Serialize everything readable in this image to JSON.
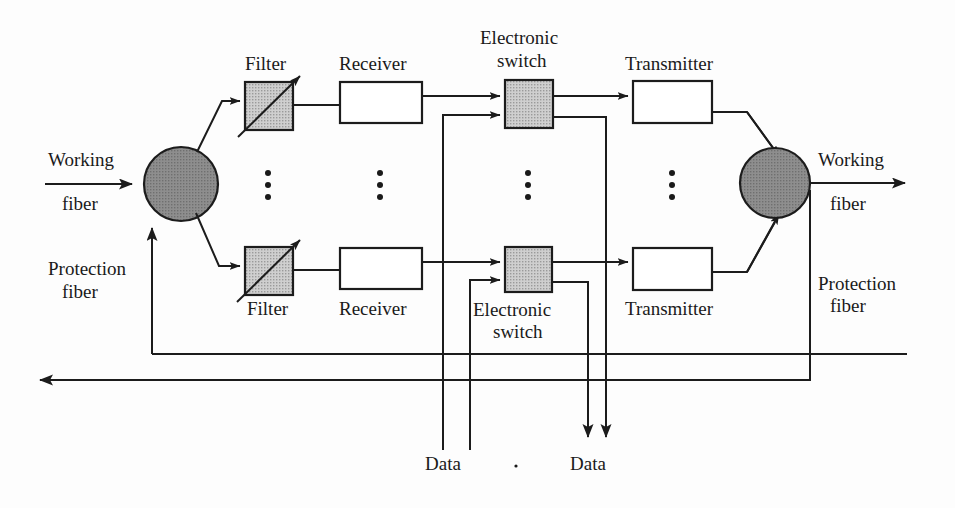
{
  "diagram": {
    "colors": {
      "line": "#1c1c1c",
      "node_fill": "#8c8c8c",
      "component_fill": "#c9c9c9",
      "box_fill": "#ffffff",
      "background": "#fdfdfd"
    },
    "labels": {
      "working_fiber_in": "Working\nfiber",
      "working_in_line1": "Working",
      "working_in_line2": "fiber",
      "protection_fiber_in_line1": "Protection",
      "protection_fiber_in_line2": "fiber",
      "working_fiber_out_line1": "Working",
      "working_fiber_out_line2": "fiber",
      "protection_fiber_out_line1": "Protection",
      "protection_fiber_out_line2": "fiber",
      "filter_top": "Filter",
      "filter_bottom": "Filter",
      "receiver_top": "Receiver",
      "receiver_bottom": "Receiver",
      "switch_top_line1": "Electronic",
      "switch_top_line2": "switch",
      "switch_bottom_line1": "Electronic",
      "switch_bottom_line2": "switch",
      "transmitter_top": "Transmitter",
      "transmitter_bottom": "Transmitter",
      "data_in": "Data",
      "data_out": "Data"
    },
    "components": [
      {
        "name": "optical-splitter-left",
        "type": "circle",
        "cx": 181,
        "cy": 184,
        "r": 37
      },
      {
        "name": "optical-combiner-right",
        "type": "circle",
        "cx": 775,
        "cy": 183,
        "r": 35
      },
      {
        "name": "filter-top",
        "type": "filter",
        "x": 245,
        "y": 82,
        "w": 48,
        "h": 48
      },
      {
        "name": "filter-bottom",
        "type": "filter",
        "x": 245,
        "y": 247,
        "w": 48,
        "h": 48
      },
      {
        "name": "receiver-top",
        "type": "box",
        "x": 340,
        "y": 82,
        "w": 82,
        "h": 41
      },
      {
        "name": "receiver-bottom",
        "type": "box",
        "x": 340,
        "y": 248,
        "w": 82,
        "h": 41
      },
      {
        "name": "electronic-switch-top",
        "type": "switch",
        "x": 505,
        "y": 80,
        "w": 48,
        "h": 48
      },
      {
        "name": "electronic-switch-bottom",
        "type": "switch",
        "x": 505,
        "y": 247,
        "w": 47,
        "h": 45
      },
      {
        "name": "transmitter-top",
        "type": "box",
        "x": 633,
        "y": 81,
        "w": 79,
        "h": 42
      },
      {
        "name": "transmitter-bottom",
        "type": "box",
        "x": 633,
        "y": 248,
        "w": 79,
        "h": 42
      }
    ],
    "ellipsis_columns": [
      268,
      380,
      528,
      672
    ],
    "ellipsis_y": [
      173,
      185,
      197
    ]
  }
}
